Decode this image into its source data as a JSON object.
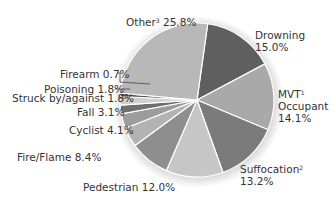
{
  "chart_data": {
    "type": "pie",
    "title": "",
    "slices": [
      {
        "label": "Drowning",
        "value": 15.0,
        "color": "#5f5f5f"
      },
      {
        "label": "MVT Occupant",
        "sup": "1",
        "value": 14.1,
        "color": "#a9a9a9"
      },
      {
        "label": "Suffocation",
        "sup": "2",
        "value": 13.2,
        "color": "#7b7b7b"
      },
      {
        "label": "Pedestrian",
        "value": 12.0,
        "color": "#c6c6c6"
      },
      {
        "label": "Fire/Flame",
        "value": 8.4,
        "color": "#8e8e8e"
      },
      {
        "label": "Cyclist",
        "value": 4.1,
        "color": "#b3b3b3"
      },
      {
        "label": "Fall",
        "value": 3.1,
        "color": "#9c9c9c"
      },
      {
        "label": "Struck by/against",
        "value": 1.8,
        "color": "#6e6e6e"
      },
      {
        "label": "Poisoning",
        "value": 1.8,
        "color": "#d0d0d0"
      },
      {
        "label": "Firearm",
        "value": 0.7,
        "color": "#555555"
      },
      {
        "label": "Other",
        "sup": "3",
        "value": 25.8,
        "color": "#b8b8b8"
      }
    ],
    "start_angle_deg": 8,
    "direction": "clockwise"
  },
  "labels": {
    "other": "Other",
    "other_sup": "3",
    "other_pct": "25.8%",
    "drowning": "Drowning",
    "drowning_pct": "15.0%",
    "mvt_1": "MVT",
    "mvt_sup": "1",
    "mvt_2": "Occupant",
    "mvt_pct": "14.1%",
    "suffocation": "Suffocation",
    "suffocation_sup": "2",
    "suffocation_pct": "13.2%",
    "pedestrian": "Pedestrian 12.0%",
    "fire": "Fire/Flame 8.4%",
    "cyclist": "Cyclist 4.1%",
    "fall": "Fall 3.1%",
    "struck": "Struck by/against 1.8%",
    "poisoning": "Poisoning 1.8%",
    "firearm": "Firearm 0.7%"
  }
}
